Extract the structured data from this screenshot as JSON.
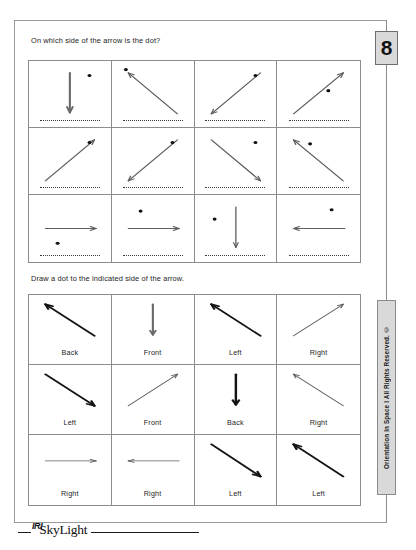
{
  "page": {
    "number": "8",
    "sidebar_text": "Orientation In Space I   All Rights Reserved. ©"
  },
  "logo": {
    "mark": "IRI",
    "name": "SkyLight"
  },
  "sections": [
    {
      "id": "identify",
      "prompt": "On which side of the arrow is the dot?",
      "cells": [
        {
          "arrow": "down",
          "dot": "upper-right",
          "weight": "medium",
          "answer": ""
        },
        {
          "arrow": "upper-left",
          "dot": "arrow-tip",
          "weight": "thin",
          "answer": ""
        },
        {
          "arrow": "lower-left",
          "dot": "upper-right",
          "weight": "thin",
          "answer": ""
        },
        {
          "arrow": "upper-right",
          "dot": "below-mid",
          "weight": "thin",
          "answer": ""
        },
        {
          "arrow": "upper-right",
          "dot": "upper-right",
          "weight": "thin",
          "answer": ""
        },
        {
          "arrow": "lower-left",
          "dot": "upper-right",
          "weight": "thin",
          "answer": ""
        },
        {
          "arrow": "lower-right",
          "dot": "upper-right",
          "weight": "thin",
          "answer": ""
        },
        {
          "arrow": "upper-left",
          "dot": "right-of-tip",
          "weight": "thin",
          "answer": ""
        },
        {
          "arrow": "right",
          "dot": "below-left",
          "weight": "thin",
          "answer": ""
        },
        {
          "arrow": "right",
          "dot": "above-left",
          "weight": "thin",
          "answer": ""
        },
        {
          "arrow": "down",
          "dot": "left-upper",
          "weight": "thin",
          "answer": ""
        },
        {
          "arrow": "left",
          "dot": "above-right",
          "weight": "thin",
          "answer": ""
        }
      ]
    },
    {
      "id": "draw",
      "prompt": "Draw a dot to the indicated side of the arrow.",
      "cells": [
        {
          "arrow": "upper-left",
          "label": "Back",
          "weight": "bold"
        },
        {
          "arrow": "down",
          "label": "Front",
          "weight": "medium"
        },
        {
          "arrow": "upper-left",
          "label": "Left",
          "weight": "bold"
        },
        {
          "arrow": "upper-right",
          "label": "Right",
          "weight": "thin"
        },
        {
          "arrow": "lower-right",
          "label": "Left",
          "weight": "bold"
        },
        {
          "arrow": "upper-right",
          "label": "Front",
          "weight": "thin"
        },
        {
          "arrow": "down",
          "label": "Back",
          "weight": "bold"
        },
        {
          "arrow": "upper-left",
          "label": "Right",
          "weight": "thin"
        },
        {
          "arrow": "right",
          "label": "Right",
          "weight": "thin"
        },
        {
          "arrow": "left",
          "label": "Right",
          "weight": "thin"
        },
        {
          "arrow": "lower-right",
          "label": "Left",
          "weight": "bold"
        },
        {
          "arrow": "upper-left",
          "label": "Left",
          "weight": "bold"
        }
      ]
    }
  ]
}
